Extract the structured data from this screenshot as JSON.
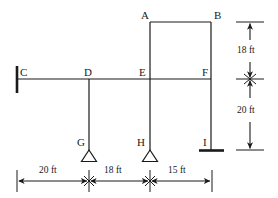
{
  "figure": {
    "type": "structural-frame-diagram",
    "units": "ft",
    "stroke_color": "#1a1a1a",
    "background_color": "#ffffff"
  },
  "joints": [
    {
      "id": "A",
      "label": "A",
      "x": 150,
      "y": 22,
      "label_x": 141,
      "label_y": 10
    },
    {
      "id": "B",
      "label": "B",
      "x": 211,
      "y": 22,
      "label_x": 214,
      "label_y": 10
    },
    {
      "id": "C",
      "label": "C",
      "x": 17,
      "y": 79,
      "label_x": 20,
      "label_y": 67
    },
    {
      "id": "D",
      "label": "D",
      "x": 89,
      "y": 79,
      "label_x": 85,
      "label_y": 67
    },
    {
      "id": "E",
      "label": "E",
      "x": 150,
      "y": 79,
      "label_x": 139,
      "label_y": 67
    },
    {
      "id": "F",
      "label": "F",
      "x": 211,
      "y": 79,
      "label_x": 202,
      "label_y": 67
    },
    {
      "id": "G",
      "label": "G",
      "x": 89,
      "y": 150,
      "label_x": 77,
      "label_y": 137
    },
    {
      "id": "H",
      "label": "H",
      "x": 150,
      "y": 150,
      "label_x": 138,
      "label_y": 137
    },
    {
      "id": "I",
      "label": "I",
      "x": 211,
      "y": 150,
      "label_x": 203,
      "label_y": 137
    }
  ],
  "members": [
    {
      "name": "beam-CF",
      "from": "C",
      "to": "F",
      "orientation": "horizontal"
    },
    {
      "name": "beam-AB",
      "from": "A",
      "to": "B",
      "orientation": "horizontal"
    },
    {
      "name": "column-AE",
      "from": "A",
      "to": "E",
      "orientation": "vertical"
    },
    {
      "name": "column-BF",
      "from": "B",
      "to": "F",
      "orientation": "vertical"
    },
    {
      "name": "column-DG",
      "from": "D",
      "to": "G",
      "orientation": "vertical"
    },
    {
      "name": "column-EH",
      "from": "E",
      "to": "H",
      "orientation": "vertical"
    },
    {
      "name": "column-FI",
      "from": "F",
      "to": "I",
      "orientation": "vertical"
    }
  ],
  "supports": [
    {
      "name": "wall-support-C",
      "kind": "fixed-wall",
      "at": "C"
    },
    {
      "name": "pin-support-G",
      "kind": "triangle-pin",
      "at": "G"
    },
    {
      "name": "pin-support-H",
      "kind": "triangle-pin",
      "at": "H"
    },
    {
      "name": "base-support-I",
      "kind": "fixed-base",
      "at": "I"
    }
  ],
  "vertical_dimensions": {
    "axis_x": 250,
    "items": [
      {
        "name": "dim-18ft-vertical",
        "label": "18 ft",
        "value": 18,
        "unit": "ft",
        "from_y": 22,
        "to_y": 79,
        "label_x": 237,
        "label_y": 46
      },
      {
        "name": "dim-20ft-vertical",
        "label": "20 ft",
        "value": 20,
        "unit": "ft",
        "from_y": 79,
        "to_y": 150,
        "label_x": 237,
        "label_y": 106
      }
    ]
  },
  "horizontal_dimensions": {
    "axis_y": 181,
    "items": [
      {
        "name": "dim-20ft-horizontal",
        "label": "20 ft",
        "value": 20,
        "unit": "ft",
        "from_x": 17,
        "to_x": 89,
        "label_x": 38,
        "label_y": 166
      },
      {
        "name": "dim-18ft-horizontal",
        "label": "18 ft",
        "value": 18,
        "unit": "ft",
        "from_x": 89,
        "to_x": 150,
        "label_x": 103,
        "label_y": 166
      },
      {
        "name": "dim-15ft-horizontal",
        "label": "15 ft",
        "value": 15,
        "unit": "ft",
        "from_x": 150,
        "to_x": 212,
        "label_x": 167,
        "label_y": 166
      }
    ]
  }
}
